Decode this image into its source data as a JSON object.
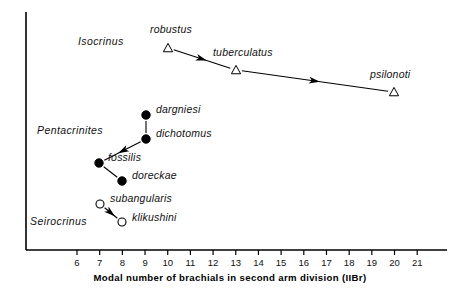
{
  "figure": {
    "type": "scatter",
    "axis": {
      "x_label": "Modal number of brachials in second arm division (IIBr)",
      "x_ticks": [
        6,
        7,
        8,
        9,
        10,
        11,
        12,
        13,
        14,
        15,
        16,
        17,
        18,
        19,
        20,
        21
      ],
      "x_min": 6,
      "x_max": 21,
      "y_axis_visible": true,
      "y_ticks": []
    },
    "genus_labels": [
      {
        "name": "Isocrinus",
        "x": 78,
        "y": 42
      },
      {
        "name": "Pentacrinites",
        "x": 37,
        "y": 131
      },
      {
        "name": "Seirocrinus",
        "x": 30,
        "y": 222
      }
    ],
    "groups": [
      {
        "genus": "Isocrinus",
        "marker": "open-triangle",
        "points": [
          {
            "label": "robustus",
            "x_value": 10,
            "px": 168,
            "py": 48,
            "label_px": 150,
            "label_py": 30
          },
          {
            "label": "tuberculatus",
            "x_value": 13,
            "px": 236,
            "py": 70,
            "label_px": 213,
            "label_py": 53
          },
          {
            "label": "psilonoti",
            "x_value": 20,
            "px": 394,
            "py": 92,
            "label_px": 370,
            "label_py": 75
          }
        ],
        "connectors": [
          {
            "from": "robustus",
            "to": "tuberculatus",
            "arrow": true
          },
          {
            "from": "tuberculatus",
            "to": "psilonoti",
            "arrow": true
          }
        ]
      },
      {
        "genus": "Pentacrinites",
        "marker": "filled-circle",
        "points": [
          {
            "label": "dargniesi",
            "x_value": 9,
            "px": 146,
            "py": 115,
            "label_px": 156,
            "label_py": 110
          },
          {
            "label": "dichotomus",
            "x_value": 9,
            "px": 146,
            "py": 139,
            "label_px": 156,
            "label_py": 134
          },
          {
            "label": "fossilis",
            "x_value": 7,
            "px": 99,
            "py": 163,
            "label_px": 108,
            "label_py": 158
          },
          {
            "label": "doreckae",
            "x_value": 8,
            "px": 122,
            "py": 181,
            "label_px": 132,
            "label_py": 176
          }
        ],
        "connectors": [
          {
            "from": "dargniesi",
            "to": "dichotomus",
            "arrow": false
          },
          {
            "from": "dichotomus",
            "to": "fossilis",
            "arrow": true
          },
          {
            "from": "fossilis",
            "to": "doreckae",
            "arrow": false
          }
        ]
      },
      {
        "genus": "Seirocrinus",
        "marker": "open-circle",
        "points": [
          {
            "label": "subangularis",
            "x_value": 7,
            "px": 100,
            "py": 204,
            "label_px": 110,
            "label_py": 199
          },
          {
            "label": "klikushini",
            "x_value": 8,
            "px": 122,
            "py": 222,
            "label_px": 132,
            "label_py": 218
          }
        ],
        "connectors": [
          {
            "from": "subangularis",
            "to": "klikushini",
            "arrow": true
          }
        ]
      }
    ],
    "colors": {
      "axis": "#000000",
      "marker_fill": "#000000",
      "marker_open": "#ffffff",
      "text": "#111111"
    }
  },
  "chart_data": {
    "type": "scatter",
    "title": "",
    "xlabel": "Modal number of brachials in second arm division (IIBr)",
    "ylabel": "",
    "xlim": [
      6,
      21
    ],
    "grid": false,
    "legend": "none",
    "categories": [
      "Isocrinus",
      "Pentacrinites",
      "Seirocrinus"
    ],
    "series": [
      {
        "name": "Isocrinus",
        "marker": "open triangle",
        "points": [
          {
            "label": "robustus",
            "x": 10
          },
          {
            "label": "tuberculatus",
            "x": 13
          },
          {
            "label": "psilonoti",
            "x": 20
          }
        ],
        "arrows": [
          "robustus -> tuberculatus",
          "tuberculatus -> psilonoti"
        ]
      },
      {
        "name": "Pentacrinites",
        "marker": "filled circle",
        "points": [
          {
            "label": "dargniesi",
            "x": 9
          },
          {
            "label": "dichotomus",
            "x": 9
          },
          {
            "label": "fossilis",
            "x": 7
          },
          {
            "label": "doreckae",
            "x": 8
          }
        ],
        "arrows": [
          "dichotomus -> fossilis"
        ]
      },
      {
        "name": "Seirocrinus",
        "marker": "open circle",
        "points": [
          {
            "label": "subangularis",
            "x": 7
          },
          {
            "label": "klikushini",
            "x": 8
          }
        ],
        "arrows": [
          "subangularis -> klikushini"
        ]
      }
    ],
    "tick_labels": [
      "6",
      "7",
      "8",
      "9",
      "10",
      "11",
      "12",
      "13",
      "14",
      "15",
      "16",
      "17",
      "18",
      "19",
      "20",
      "21"
    ]
  }
}
